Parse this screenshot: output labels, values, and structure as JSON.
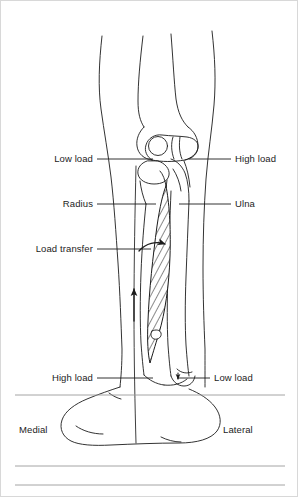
{
  "figure": {
    "kind": "anatomical-line-drawing",
    "orientation_labels": {
      "left": "Medial",
      "right": "Lateral"
    },
    "labels": [
      {
        "id": "low-load-top",
        "text": "Low load",
        "side": "left",
        "leader_y": 158
      },
      {
        "id": "high-load-top",
        "text": "High load",
        "side": "right",
        "leader_y": 158
      },
      {
        "id": "radius",
        "text": "Radius",
        "side": "left",
        "leader_y": 203
      },
      {
        "id": "ulna",
        "text": "Ulna",
        "side": "right",
        "leader_y": 203
      },
      {
        "id": "load-transfer",
        "text": "Load transfer",
        "side": "left",
        "leader_y": 248
      },
      {
        "id": "high-load-bottom",
        "text": "High load",
        "side": "left",
        "leader_y": 377
      },
      {
        "id": "low-load-bottom",
        "text": "Low load",
        "side": "right",
        "leader_y": 377
      }
    ],
    "arrows": [
      {
        "id": "load-transfer-arrow-upper",
        "direction": "up-right",
        "description": "curved arrow crossing interosseous membrane"
      },
      {
        "id": "load-transfer-arrow-lower",
        "direction": "up",
        "description": "straight arrow along radius shaft"
      },
      {
        "id": "distal-load-arrow",
        "direction": "down",
        "description": "small arrow at distal ulna"
      }
    ],
    "colors": {
      "ink": "#1c1c1c",
      "background": "#ffffff",
      "membrane_hatch": "#6a6a6a",
      "rule": "#9a9a9a"
    },
    "page_rules": [
      {
        "id": "rule-top",
        "y": 394
      },
      {
        "id": "rule-middle",
        "y": 465
      },
      {
        "id": "rule-bottom",
        "y": 484
      }
    ]
  }
}
